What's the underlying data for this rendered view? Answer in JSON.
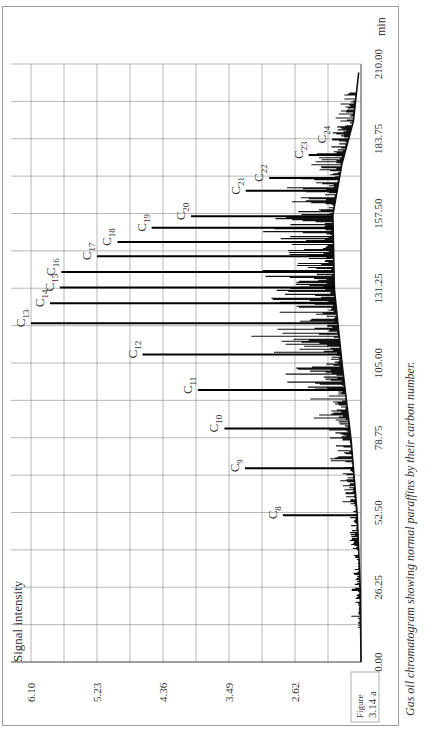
{
  "figure": {
    "label_line1": "Figure",
    "label_line2": "3.14 a",
    "caption": "Gas oil chromatogram showing normal paraffins by their carbon number."
  },
  "chart_data": {
    "type": "line",
    "title": "Gas oil chromatogram showing normal paraffins by their carbon number.",
    "orientation": "rotated-90-ccw",
    "xlabel": "min",
    "ylabel": "Signal intensity",
    "x_ticks": [
      "0.00",
      "26.25",
      "52.50",
      "78.75",
      "105.00",
      "131.25",
      "157.50",
      "183.75",
      "210.00"
    ],
    "y_ticks": [
      "1.75",
      "2.62",
      "3.49",
      "4.36",
      "5.23",
      "6.10"
    ],
    "xlim": [
      0,
      210
    ],
    "ylim": [
      1.75,
      6.1
    ],
    "grid": true,
    "peaks": [
      {
        "label": "C8",
        "sub": "8",
        "time": 51.5,
        "intensity": 2.78
      },
      {
        "label": "C9",
        "sub": "9",
        "time": 68.0,
        "intensity": 3.28
      },
      {
        "label": "C10",
        "sub": "10",
        "time": 82.0,
        "intensity": 3.55
      },
      {
        "label": "C11",
        "sub": "11",
        "time": 95.5,
        "intensity": 3.9
      },
      {
        "label": "C12",
        "sub": "12",
        "time": 108.0,
        "intensity": 4.63
      },
      {
        "label": "C13",
        "sub": "13",
        "time": 119.0,
        "intensity": 6.1
      },
      {
        "label": "C14",
        "sub": "14",
        "time": 126.0,
        "intensity": 5.85
      },
      {
        "label": "C15",
        "sub": "15",
        "time": 131.5,
        "intensity": 5.72
      },
      {
        "label": "C16",
        "sub": "16",
        "time": 137.0,
        "intensity": 5.7
      },
      {
        "label": "C17",
        "sub": "17",
        "time": 142.5,
        "intensity": 5.23
      },
      {
        "label": "C18",
        "sub": "18",
        "time": 147.5,
        "intensity": 4.96
      },
      {
        "label": "C19",
        "sub": "19",
        "time": 152.5,
        "intensity": 4.51
      },
      {
        "label": "C20",
        "sub": "20",
        "time": 156.5,
        "intensity": 3.99
      },
      {
        "label": "C21",
        "sub": "21",
        "time": 165.5,
        "intensity": 3.27
      },
      {
        "label": "C22",
        "sub": "22",
        "time": 170.0,
        "intensity": 2.96
      },
      {
        "label": "C23",
        "sub": "23",
        "time": 178.0,
        "intensity": 2.44
      },
      {
        "label": "C24",
        "sub": "24",
        "time": 183.5,
        "intensity": 2.13
      }
    ],
    "baseline": [
      {
        "time": 0,
        "intensity": 1.75
      },
      {
        "time": 26,
        "intensity": 1.76
      },
      {
        "time": 52,
        "intensity": 1.8
      },
      {
        "time": 78,
        "intensity": 1.88
      },
      {
        "time": 105,
        "intensity": 2.0
      },
      {
        "time": 131,
        "intensity": 2.1
      },
      {
        "time": 157,
        "intensity": 2.12
      },
      {
        "time": 175,
        "intensity": 2.0
      },
      {
        "time": 190,
        "intensity": 1.85
      },
      {
        "time": 207,
        "intensity": 1.78
      }
    ]
  }
}
